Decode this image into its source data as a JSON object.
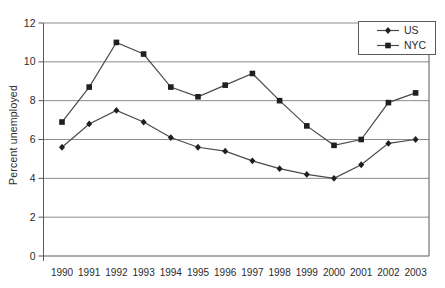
{
  "colors": {
    "background": "#ffffff",
    "gridline": "#8c8c8c",
    "axis": "#5a5a5a",
    "series_line": "#4a4a4a",
    "marker": "#1f1f1f",
    "text": "#2b2b2b",
    "legend_border": "#5a5a5a"
  },
  "chart_data": {
    "type": "line",
    "title": "",
    "xlabel": "",
    "ylabel": "Percent unemployed",
    "ylim": [
      0,
      12
    ],
    "yticks": [
      0,
      2,
      4,
      6,
      8,
      10,
      12
    ],
    "grid": true,
    "legend_position": "top-right",
    "categories": [
      "1990",
      "1991",
      "1992",
      "1993",
      "1994",
      "1995",
      "1996",
      "1997",
      "1998",
      "1999",
      "2000",
      "2001",
      "2002",
      "2003"
    ],
    "series": [
      {
        "name": "US",
        "marker": "diamond",
        "values": [
          5.6,
          6.8,
          7.5,
          6.9,
          6.1,
          5.6,
          5.4,
          4.9,
          4.5,
          4.2,
          4.0,
          4.7,
          5.8,
          6.0
        ]
      },
      {
        "name": "NYC",
        "marker": "square",
        "values": [
          6.9,
          8.7,
          11.0,
          10.4,
          8.7,
          8.2,
          8.8,
          9.4,
          8.0,
          6.7,
          5.7,
          6.0,
          7.9,
          8.4
        ]
      }
    ]
  }
}
